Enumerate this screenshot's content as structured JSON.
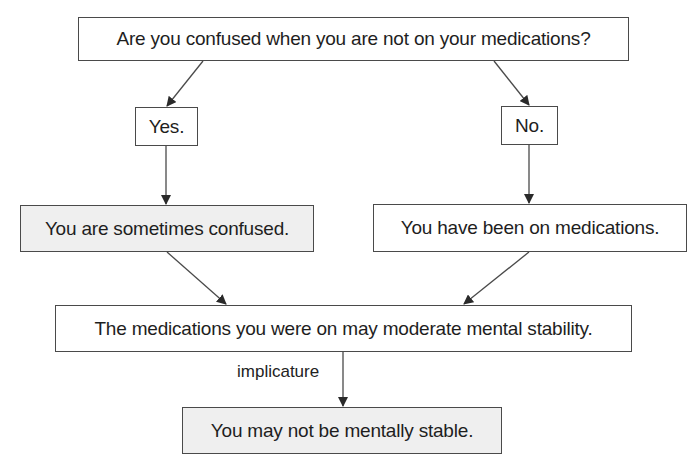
{
  "diagram": {
    "type": "flowchart",
    "nodes": {
      "question": {
        "text": "Are you confused when you are not on your medications?",
        "shaded": false
      },
      "yes": {
        "text": "Yes.",
        "shaded": false
      },
      "no": {
        "text": "No.",
        "shaded": false
      },
      "sometimes_confused": {
        "text": "You are sometimes confused.",
        "shaded": true
      },
      "been_on_meds": {
        "text": "You have been on medications.",
        "shaded": false
      },
      "meds_moderate": {
        "text": "The medications you were on may moderate mental stability.",
        "shaded": false
      },
      "not_stable": {
        "text": "You may not be mentally stable.",
        "shaded": true
      }
    },
    "edges": [
      {
        "from": "question",
        "to": "yes",
        "label": ""
      },
      {
        "from": "question",
        "to": "no",
        "label": ""
      },
      {
        "from": "yes",
        "to": "sometimes_confused",
        "label": ""
      },
      {
        "from": "no",
        "to": "been_on_meds",
        "label": ""
      },
      {
        "from": "sometimes_confused",
        "to": "meds_moderate",
        "label": ""
      },
      {
        "from": "been_on_meds",
        "to": "meds_moderate",
        "label": ""
      },
      {
        "from": "meds_moderate",
        "to": "not_stable",
        "label": "implicature"
      }
    ],
    "edge_labels": {
      "implicature": "implicature"
    },
    "colors": {
      "stroke": "#4a4a4a",
      "text": "#1e1e1e",
      "shaded_fill": "#efefef",
      "plain_fill": "#ffffff"
    }
  }
}
